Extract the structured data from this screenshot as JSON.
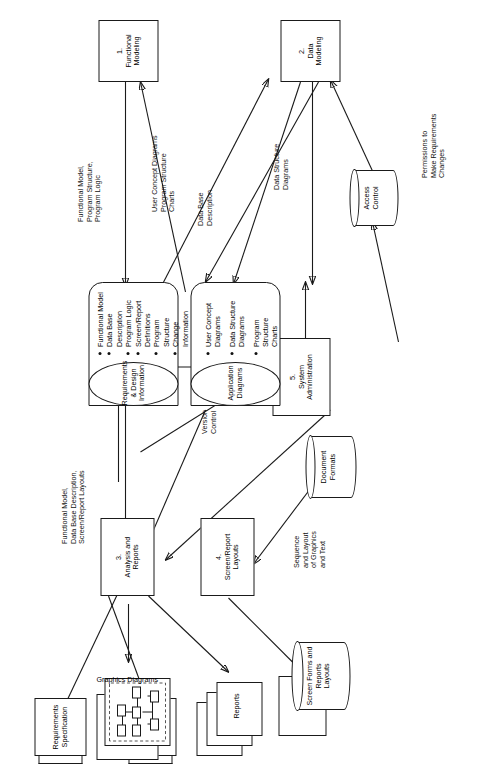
{
  "exhibit": {
    "title": "EXHIBIT 16-3. Generic Model of a Computer-Aided Software Engineering Environment"
  },
  "processes": [
    {
      "id": "p1",
      "number": "1.",
      "name": "Functional\nModeling",
      "label": "1.\nFunctional\nModeling"
    },
    {
      "id": "p2",
      "number": "2.",
      "name": "Data\nModeling",
      "label": "2.\nData\nModeling"
    },
    {
      "id": "p3",
      "number": "3.",
      "name": "Analysis and\nReports",
      "label": "3.\nAnalysis and\nReports"
    },
    {
      "id": "p4",
      "number": "4.",
      "name": "Screen/Report\nLayouts",
      "label": "4.\nScreen/Report\nLayouts"
    },
    {
      "id": "p5",
      "number": "5.",
      "name": "System\nAdministration",
      "label": "5.\nSystem\nAdministration"
    }
  ],
  "data_stores": [
    {
      "id": "ds1",
      "name": "Requirements\n& Design\nInformation",
      "items": [
        "Functional Model",
        "Data Base Description",
        "Program Logic",
        "Screen/Report\nDefinitions",
        "Program Structure",
        "Change Information"
      ]
    },
    {
      "id": "ds2",
      "name": "Application\nDiagrams",
      "items": [
        "User Concept\nDiagrams",
        "Data Structure\nDiagrams",
        "Program Structure\nCharts"
      ]
    }
  ],
  "cylinders": [
    {
      "id": "cyl_doc",
      "name": "Document\nFormats"
    },
    {
      "id": "cyl_access",
      "name": "Access\nControl"
    },
    {
      "id": "cyl_screen",
      "name": "Screen Forms and\nReports\nLayouts"
    }
  ],
  "documents": [
    {
      "id": "doc_req",
      "name": "Requirements\nSpecification"
    },
    {
      "id": "doc_design",
      "name": "Design\nSpecification"
    }
  ],
  "stacks": [
    {
      "id": "stk_graphics",
      "name": "Graphics Diagrams"
    },
    {
      "id": "stk_reports",
      "name": "Reports"
    }
  ],
  "flows": [
    {
      "id": "f1",
      "label": "Functional Model,\nProgram Structure,\nProgram Logic"
    },
    {
      "id": "f2",
      "label": "User Concept Diagrams\nProgram Structure\nCharts"
    },
    {
      "id": "f3",
      "label": "Data Base\nDescription"
    },
    {
      "id": "f4",
      "label": "Data Structure\nDiagrams"
    },
    {
      "id": "f5",
      "label": "Permissions to\nMake Requirements\nChanges"
    },
    {
      "id": "f6",
      "label": "Functional Model,\nData Base Description,\nScreen/Report Layouts"
    },
    {
      "id": "f7",
      "label": "Sequence\nand Layout\nof Graphics\nand Text"
    },
    {
      "id": "f8",
      "label": "Version\nControl"
    }
  ],
  "colors": {
    "ink": "#1a1a1a",
    "paper": "#ffffff",
    "dash": "#555555"
  }
}
